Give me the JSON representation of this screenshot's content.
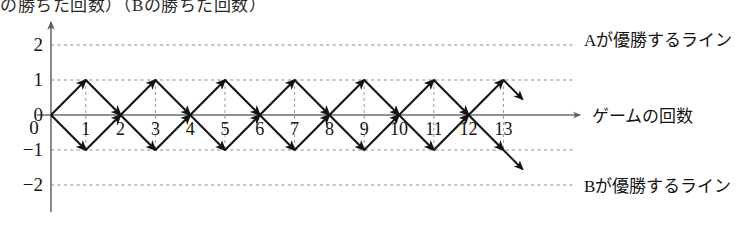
{
  "figure": {
    "title_clipped": "の勝ちた回数）（Bの勝ちた回数）",
    "axis_x_label": "ゲームの回数",
    "line_labels": {
      "top": "Aが優勝するライン",
      "bottom": "Bが優勝するライン"
    }
  },
  "chart_data": {
    "type": "line",
    "title": "",
    "xlabel": "ゲームの回数",
    "ylabel": "",
    "xlim": [
      0,
      13
    ],
    "ylim": [
      -2.6,
      2.6
    ],
    "grid": true,
    "legend": "none",
    "x_ticks": [
      1,
      2,
      3,
      4,
      5,
      6,
      7,
      8,
      9,
      10,
      11,
      12,
      13
    ],
    "y_ticks": [
      2,
      1,
      0,
      -1,
      -2
    ],
    "y_tick_labels": [
      "2",
      "1",
      "0",
      "−1",
      "−2"
    ],
    "gridlines_y": [
      2,
      1,
      -1,
      -2
    ],
    "vertical_dashed_x": [
      1,
      3,
      5,
      7,
      9,
      11,
      13
    ],
    "annotations": [
      {
        "text": "Aが優勝するライン",
        "y": 2,
        "x": 13.8,
        "align": "left"
      },
      {
        "text": "Bが優勝するライン",
        "y": -2,
        "x": 13.8,
        "align": "left"
      },
      {
        "text": "ゲームの回数",
        "y": 0,
        "x": 14.2,
        "align": "left"
      }
    ],
    "nodes": [
      {
        "x": 0,
        "y": 0
      },
      {
        "x": 1,
        "y": 1
      },
      {
        "x": 1,
        "y": -1
      },
      {
        "x": 2,
        "y": 0
      },
      {
        "x": 3,
        "y": 1
      },
      {
        "x": 3,
        "y": -1
      },
      {
        "x": 4,
        "y": 0
      },
      {
        "x": 5,
        "y": 1
      },
      {
        "x": 5,
        "y": -1
      },
      {
        "x": 6,
        "y": 0
      },
      {
        "x": 7,
        "y": 1
      },
      {
        "x": 7,
        "y": -1
      },
      {
        "x": 8,
        "y": 0
      },
      {
        "x": 9,
        "y": 1
      },
      {
        "x": 9,
        "y": -1
      },
      {
        "x": 10,
        "y": 0
      },
      {
        "x": 11,
        "y": 1
      },
      {
        "x": 11,
        "y": -1
      },
      {
        "x": 12,
        "y": 0
      },
      {
        "x": 13,
        "y": 1
      },
      {
        "x": 13,
        "y": -1
      }
    ],
    "edges": [
      {
        "from": [
          0,
          0
        ],
        "to": [
          1,
          1
        ]
      },
      {
        "from": [
          0,
          0
        ],
        "to": [
          1,
          -1
        ]
      },
      {
        "from": [
          1,
          1
        ],
        "to": [
          2,
          0
        ]
      },
      {
        "from": [
          1,
          -1
        ],
        "to": [
          2,
          0
        ]
      },
      {
        "from": [
          2,
          0
        ],
        "to": [
          3,
          1
        ]
      },
      {
        "from": [
          2,
          0
        ],
        "to": [
          3,
          -1
        ]
      },
      {
        "from": [
          3,
          1
        ],
        "to": [
          4,
          0
        ]
      },
      {
        "from": [
          3,
          -1
        ],
        "to": [
          4,
          0
        ]
      },
      {
        "from": [
          4,
          0
        ],
        "to": [
          5,
          1
        ]
      },
      {
        "from": [
          4,
          0
        ],
        "to": [
          5,
          -1
        ]
      },
      {
        "from": [
          5,
          1
        ],
        "to": [
          6,
          0
        ]
      },
      {
        "from": [
          5,
          -1
        ],
        "to": [
          6,
          0
        ]
      },
      {
        "from": [
          6,
          0
        ],
        "to": [
          7,
          1
        ]
      },
      {
        "from": [
          6,
          0
        ],
        "to": [
          7,
          -1
        ]
      },
      {
        "from": [
          7,
          1
        ],
        "to": [
          8,
          0
        ]
      },
      {
        "from": [
          7,
          -1
        ],
        "to": [
          8,
          0
        ]
      },
      {
        "from": [
          8,
          0
        ],
        "to": [
          9,
          1
        ]
      },
      {
        "from": [
          8,
          0
        ],
        "to": [
          9,
          -1
        ]
      },
      {
        "from": [
          9,
          1
        ],
        "to": [
          10,
          0
        ]
      },
      {
        "from": [
          9,
          -1
        ],
        "to": [
          10,
          0
        ]
      },
      {
        "from": [
          10,
          0
        ],
        "to": [
          11,
          1
        ]
      },
      {
        "from": [
          10,
          0
        ],
        "to": [
          11,
          -1
        ]
      },
      {
        "from": [
          11,
          1
        ],
        "to": [
          12,
          0
        ]
      },
      {
        "from": [
          11,
          -1
        ],
        "to": [
          12,
          0
        ]
      },
      {
        "from": [
          12,
          0
        ],
        "to": [
          13,
          1
        ]
      },
      {
        "from": [
          12,
          0
        ],
        "to": [
          13,
          -1
        ]
      },
      {
        "from": [
          13,
          1
        ],
        "to": [
          13.55,
          0.45
        ],
        "stub": true
      },
      {
        "from": [
          13,
          -1
        ],
        "to": [
          13.55,
          -1.55
        ],
        "stub": true
      }
    ]
  },
  "style": {
    "ink": "#141414",
    "grid": "#8d8d8d",
    "axis": "#6d6d6d",
    "background": "#ffffff"
  }
}
